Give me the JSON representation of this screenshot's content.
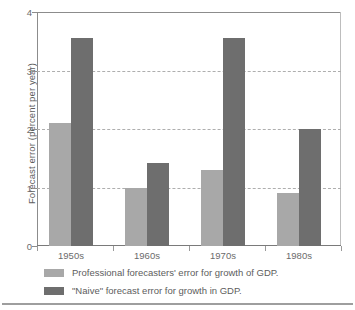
{
  "chart_data": {
    "type": "bar",
    "title": "",
    "xlabel": "",
    "ylabel": "Forecast error (percent per year)",
    "categories": [
      "1950s",
      "1960s",
      "1970s",
      "1980s"
    ],
    "series": [
      {
        "name": "Professional forecasters' error for growth of GDP.",
        "color": "#a8a8a8",
        "values": [
          2.1,
          1.0,
          1.3,
          0.9
        ]
      },
      {
        "name": "\"Naive\" forecast error for growth in GDP.",
        "color": "#6e6e6e",
        "values": [
          3.55,
          1.42,
          3.55,
          2.0
        ]
      }
    ],
    "ylim": [
      0,
      4
    ],
    "yticks": [
      0,
      1,
      2,
      3,
      4
    ],
    "ytick_labels": [
      "0",
      "1",
      "2",
      "3",
      "4"
    ],
    "gridlines": [
      1,
      2,
      3
    ],
    "grid": true,
    "legend_position": "below"
  },
  "legend": {
    "items": [
      {
        "label": "Professional forecasters' error for growth of GDP.",
        "swatch": "light"
      },
      {
        "label": "\"Naive\" forecast error for growth in GDP.",
        "swatch": "dark"
      }
    ]
  }
}
